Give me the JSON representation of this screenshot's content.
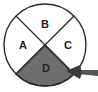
{
  "diagram": {
    "type": "quadrant-circle",
    "quadrants": [
      {
        "id": "top",
        "label": "B",
        "shaded": false
      },
      {
        "id": "left",
        "label": "A",
        "shaded": false
      },
      {
        "id": "right",
        "label": "C",
        "shaded": false
      },
      {
        "id": "bottom",
        "label": "D",
        "shaded": true
      }
    ],
    "arrow": {
      "points_to": "D",
      "from": "lower-right"
    },
    "colors": {
      "outline": "#2a2a2a",
      "shade": "#6e6e6e",
      "background": "#ffffff",
      "arrow": "#555555"
    }
  }
}
